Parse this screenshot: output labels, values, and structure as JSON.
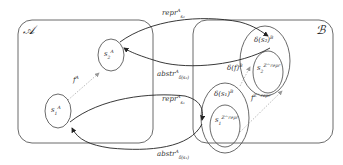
{
  "domains": {
    "a": {
      "label": "𝒜"
    },
    "b": {
      "label": "ℬ"
    }
  },
  "nodes": {
    "s1a": {
      "base": "s",
      "sub": "1",
      "sup": "A"
    },
    "s2a": {
      "base": "s",
      "sub": "2",
      "sup": "A"
    },
    "ds1": {
      "text": "δ(s₁)",
      "sup": "B"
    },
    "ds2": {
      "text": "δ(s₂)",
      "sup": "B"
    },
    "s1z": {
      "base": "s",
      "sub": "1",
      "sup": "Z^repr"
    },
    "s2z": {
      "base": "s",
      "sub": "2",
      "sup": "Z^repr"
    }
  },
  "edges": {
    "fA": {
      "base": "f",
      "sup": "A"
    },
    "dfB": {
      "text": "δ(f)",
      "sup": "B"
    },
    "fZ": {
      "base": "f",
      "sup": "Z^repr"
    },
    "repr_s2": {
      "base": "repr",
      "sup": "A",
      "sub": "s₂"
    },
    "abstr_ds2": {
      "base": "abstr",
      "sup": "A",
      "sub": "δ(s₂)"
    },
    "repr_s1": {
      "base": "repr",
      "sup": "A",
      "sub": "s₁"
    },
    "abstr_ds1": {
      "base": "abstr",
      "sup": "A",
      "sub": "δ(s₁)"
    }
  }
}
